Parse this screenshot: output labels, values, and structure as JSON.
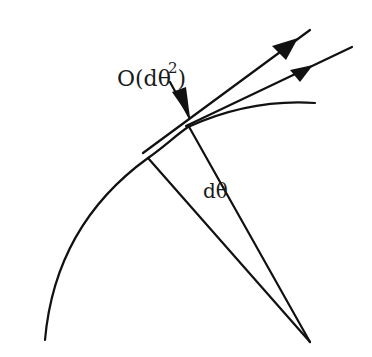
{
  "diagram": {
    "type": "geometry-figure",
    "colors": {
      "stroke": "#111111",
      "background": "#ffffff"
    },
    "labels": {
      "error_order": {
        "prefix": "O(d",
        "theta": "θ",
        "exponent": "2",
        "suffix": ")"
      },
      "angle": {
        "prefix": "d",
        "theta": "θ"
      }
    },
    "elements": [
      {
        "id": "arc",
        "kind": "curve"
      },
      {
        "id": "tangent-upper",
        "kind": "arrow-line"
      },
      {
        "id": "tangent-lower",
        "kind": "arrow-line"
      },
      {
        "id": "radius-left",
        "kind": "line"
      },
      {
        "id": "radius-right",
        "kind": "line"
      },
      {
        "id": "order-pointer",
        "kind": "arrow"
      }
    ]
  }
}
